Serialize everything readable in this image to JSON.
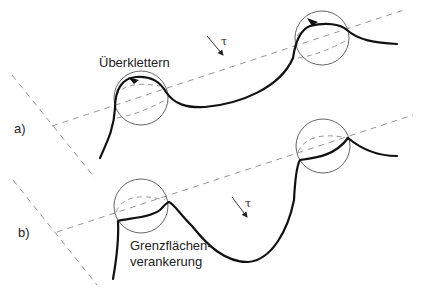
{
  "figure": {
    "type": "dislocation-particle-interaction-diagram",
    "panels": [
      {
        "id": "a",
        "label": "a)",
        "annotation": "Überklettern",
        "stress_symbol": "τ",
        "mechanism": "climb over particle",
        "particles": 2
      },
      {
        "id": "b",
        "label": "b)",
        "annotation_line1": "Grenzflächen-",
        "annotation_line2": "verankerung",
        "stress_symbol": "τ",
        "mechanism": "interface pinning",
        "particles": 2
      }
    ]
  },
  "panel_a": {
    "label": "a)",
    "annotation": "Überklettern",
    "tau": "τ"
  },
  "panel_b": {
    "label": "b)",
    "annotation_line1": "Grenzflächen-",
    "annotation_line2": "verankerung",
    "tau": "τ"
  },
  "colors": {
    "dislocation": "#111111",
    "particle_outline": "#555555",
    "slip_plane_dashes": "#8a8a8a",
    "text": "#222222",
    "background": "#ffffff"
  }
}
